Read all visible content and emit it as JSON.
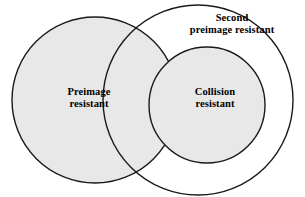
{
  "figure": {
    "kind": "venn-diagram",
    "background_color": "#ffffff",
    "stroke_color": "#1a1a1a",
    "fill_shaded": "#e8e8e8",
    "fill_clear": "#ffffff"
  },
  "labels": {
    "preimage": "Preimage\nresistant",
    "second_preimage": "Second\npreimage resistant",
    "collision": "Collision\nresistant"
  },
  "sets": [
    {
      "name": "preimage-resistant-circle",
      "label": "Preimage resistant",
      "cx": 95,
      "cy": 100,
      "r": 83,
      "shaded": true
    },
    {
      "name": "second-preimage-resistant-circle",
      "label": "Second preimage resistant",
      "cx": 198,
      "cy": 100,
      "r": 95,
      "shaded": false
    },
    {
      "name": "collision-resistant-circle",
      "label": "Collision resistant",
      "cx": 207,
      "cy": 105,
      "r": 58,
      "shaded": true
    }
  ]
}
